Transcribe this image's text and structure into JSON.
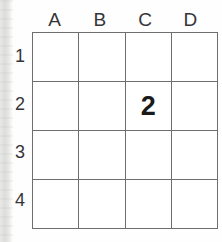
{
  "page": {
    "background_color": "#fefefe",
    "grid_line_color": "#6e6e70",
    "text_color": "#353538",
    "value_color": "#1a1a1a"
  },
  "grid": {
    "columns": [
      "A",
      "B",
      "C",
      "D"
    ],
    "rows": [
      "1",
      "2",
      "3",
      "4"
    ],
    "cells": [
      [
        "",
        "",
        "",
        ""
      ],
      [
        "",
        "",
        "2",
        ""
      ],
      [
        "",
        "",
        "",
        ""
      ],
      [
        "",
        "",
        "",
        ""
      ]
    ],
    "filled_cell": {
      "column": "C",
      "row": "2",
      "value": "2"
    }
  }
}
